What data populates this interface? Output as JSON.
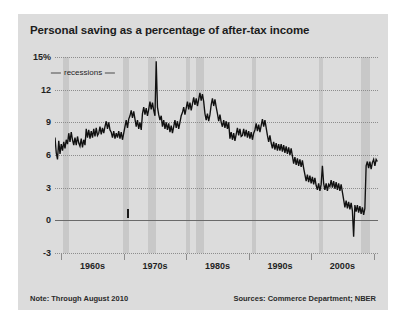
{
  "title": "Personal saving as a percentage of after-tax income",
  "annotation": {
    "recessions_label": "recessions"
  },
  "footer": {
    "note": "Note: Through August 2010",
    "sources": "Sources: Commerce Department; NBER"
  },
  "colors": {
    "panel_background": "#dcdcdc",
    "recession_band": "#c8c8c8",
    "line": "#111111",
    "gridline": "#8d8d8d",
    "zero_line": "#6a6a6a",
    "text": "#1f1f1f"
  },
  "chart_data": {
    "type": "line",
    "title": "Personal saving as a percentage of after-tax income",
    "xlabel": "",
    "ylabel": "",
    "ylim": [
      -3,
      15
    ],
    "xlim": [
      1959,
      2010.7
    ],
    "grid": true,
    "legend": "none",
    "ytick_labels": [
      "15%",
      "12",
      "9",
      "6",
      "3",
      "0",
      "-3"
    ],
    "ytick_values": [
      15,
      12,
      9,
      6,
      3,
      0,
      -3
    ],
    "xtick_labels": [
      "1960s",
      "1970s",
      "1980s",
      "1990s",
      "2000s"
    ],
    "xtick_label_centers": [
      1965,
      1975,
      1985,
      1995,
      2005
    ],
    "xtick_boundaries": [
      1960,
      1970,
      1980,
      1990,
      2000,
      2010
    ],
    "annotations": [
      {
        "text": "recessions",
        "x": 1963.5,
        "y": 13.6,
        "kind": "leader-label"
      }
    ],
    "shaded_regions": [
      {
        "label": "recession",
        "x0": 1960.3,
        "x1": 1961.2
      },
      {
        "label": "recession",
        "x0": 1969.9,
        "x1": 1970.9
      },
      {
        "label": "recession",
        "x0": 1973.9,
        "x1": 1975.2
      },
      {
        "label": "recession",
        "x0": 1980.0,
        "x1": 1980.6
      },
      {
        "label": "recession",
        "x0": 1981.6,
        "x1": 1982.9
      },
      {
        "label": "recession",
        "x0": 1990.6,
        "x1": 1991.2
      },
      {
        "label": "recession",
        "x0": 2001.2,
        "x1": 2001.9
      },
      {
        "label": "recession",
        "x0": 2007.9,
        "x1": 2009.5
      }
    ],
    "series": [
      {
        "name": "Personal saving rate",
        "x": [
          1959.0,
          1959.2,
          1959.4,
          1959.6,
          1959.8,
          1960.0,
          1960.2,
          1960.4,
          1960.6,
          1960.8,
          1961.0,
          1961.2,
          1961.4,
          1961.6,
          1961.8,
          1962.0,
          1962.2,
          1962.4,
          1962.6,
          1962.8,
          1963.0,
          1963.2,
          1963.4,
          1963.6,
          1963.8,
          1964.0,
          1964.2,
          1964.4,
          1964.6,
          1964.8,
          1965.0,
          1965.2,
          1965.4,
          1965.6,
          1965.8,
          1966.0,
          1966.2,
          1966.4,
          1966.6,
          1966.8,
          1967.0,
          1967.2,
          1967.4,
          1967.6,
          1967.8,
          1968.0,
          1968.2,
          1968.4,
          1968.6,
          1968.8,
          1969.0,
          1969.2,
          1969.4,
          1969.6,
          1969.8,
          1970.0,
          1970.2,
          1970.4,
          1970.6,
          1970.8,
          1971.0,
          1971.2,
          1971.4,
          1971.6,
          1971.8,
          1972.0,
          1972.2,
          1972.4,
          1972.6,
          1972.8,
          1973.0,
          1973.2,
          1973.4,
          1973.6,
          1973.8,
          1974.0,
          1974.2,
          1974.4,
          1974.6,
          1974.8,
          1975.0,
          1975.2,
          1975.4,
          1975.6,
          1975.8,
          1976.0,
          1976.2,
          1976.4,
          1976.6,
          1976.8,
          1977.0,
          1977.2,
          1977.4,
          1977.6,
          1977.8,
          1978.0,
          1978.2,
          1978.4,
          1978.6,
          1978.8,
          1979.0,
          1979.2,
          1979.4,
          1979.6,
          1979.8,
          1980.0,
          1980.2,
          1980.4,
          1980.6,
          1980.8,
          1981.0,
          1981.2,
          1981.4,
          1981.6,
          1981.8,
          1982.0,
          1982.2,
          1982.4,
          1982.6,
          1982.8,
          1983.0,
          1983.2,
          1983.4,
          1983.6,
          1983.8,
          1984.0,
          1984.2,
          1984.4,
          1984.6,
          1984.8,
          1985.0,
          1985.2,
          1985.4,
          1985.6,
          1985.8,
          1986.0,
          1986.2,
          1986.4,
          1986.6,
          1986.8,
          1987.0,
          1987.2,
          1987.4,
          1987.6,
          1987.8,
          1988.0,
          1988.2,
          1988.4,
          1988.6,
          1988.8,
          1989.0,
          1989.2,
          1989.4,
          1989.6,
          1989.8,
          1990.0,
          1990.2,
          1990.4,
          1990.6,
          1990.8,
          1991.0,
          1991.2,
          1991.4,
          1991.6,
          1991.8,
          1992.0,
          1992.2,
          1992.4,
          1992.6,
          1992.8,
          1993.0,
          1993.2,
          1993.4,
          1993.6,
          1993.8,
          1994.0,
          1994.2,
          1994.4,
          1994.6,
          1994.8,
          1995.0,
          1995.2,
          1995.4,
          1995.6,
          1995.8,
          1996.0,
          1996.2,
          1996.4,
          1996.6,
          1996.8,
          1997.0,
          1997.2,
          1997.4,
          1997.6,
          1997.8,
          1998.0,
          1998.2,
          1998.4,
          1998.6,
          1998.8,
          1999.0,
          1999.2,
          1999.4,
          1999.6,
          1999.8,
          2000.0,
          2000.2,
          2000.4,
          2000.6,
          2000.8,
          2001.0,
          2001.2,
          2001.4,
          2001.6,
          2001.8,
          2002.0,
          2002.2,
          2002.4,
          2002.6,
          2002.8,
          2003.0,
          2003.2,
          2003.4,
          2003.6,
          2003.8,
          2004.0,
          2004.2,
          2004.4,
          2004.6,
          2004.8,
          2005.0,
          2005.2,
          2005.4,
          2005.6,
          2005.8,
          2006.0,
          2006.2,
          2006.4,
          2006.6,
          2006.8,
          2007.0,
          2007.2,
          2007.4,
          2007.6,
          2007.8,
          2008.0,
          2008.2,
          2008.4,
          2008.6,
          2008.8,
          2009.0,
          2009.2,
          2009.4,
          2009.6,
          2009.8,
          2010.0,
          2010.2,
          2010.4,
          2010.6
        ],
        "values": [
          7.6,
          6.2,
          5.6,
          7.3,
          6.1,
          7.0,
          6.4,
          7.2,
          6.6,
          7.4,
          7.0,
          8.0,
          7.2,
          8.1,
          7.4,
          6.9,
          7.6,
          6.9,
          7.7,
          7.1,
          6.8,
          7.5,
          6.7,
          7.4,
          6.9,
          8.4,
          7.6,
          8.3,
          7.5,
          8.2,
          7.6,
          8.4,
          7.7,
          8.5,
          7.8,
          8.0,
          8.6,
          7.9,
          8.5,
          8.0,
          8.6,
          9.1,
          8.4,
          9.0,
          8.3,
          8.1,
          7.6,
          8.2,
          7.5,
          8.0,
          7.6,
          8.2,
          7.5,
          8.1,
          7.4,
          8.0,
          8.6,
          9.2,
          8.5,
          9.3,
          9.6,
          10.1,
          9.4,
          10.0,
          9.3,
          8.6,
          9.2,
          8.4,
          9.0,
          8.3,
          9.8,
          10.4,
          9.7,
          10.3,
          9.6,
          10.2,
          10.9,
          10.2,
          10.8,
          10.1,
          9.6,
          14.6,
          10.4,
          9.7,
          9.2,
          9.6,
          8.6,
          9.2,
          8.4,
          9.0,
          8.3,
          8.9,
          8.1,
          8.7,
          8.0,
          8.6,
          9.2,
          8.5,
          9.1,
          8.4,
          9.0,
          9.6,
          9.9,
          10.4,
          9.7,
          10.3,
          10.9,
          10.2,
          10.8,
          10.1,
          10.7,
          11.3,
          10.6,
          11.2,
          10.5,
          11.1,
          11.7,
          11.0,
          11.6,
          10.9,
          9.8,
          9.2,
          9.8,
          9.1,
          9.7,
          10.6,
          11.2,
          10.5,
          11.1,
          10.4,
          9.8,
          9.1,
          9.7,
          9.0,
          8.6,
          9.2,
          8.5,
          9.1,
          8.4,
          9.0,
          7.5,
          8.1,
          7.4,
          8.0,
          7.3,
          7.9,
          8.5,
          7.8,
          8.4,
          7.7,
          7.8,
          8.4,
          7.7,
          8.3,
          7.6,
          8.2,
          7.5,
          8.1,
          7.4,
          8.0,
          8.3,
          8.9,
          8.2,
          8.8,
          8.1,
          8.7,
          9.3,
          8.6,
          9.2,
          8.5,
          7.8,
          7.2,
          7.8,
          7.1,
          6.6,
          7.2,
          6.5,
          7.1,
          6.4,
          7.0,
          6.4,
          7.0,
          6.3,
          6.9,
          6.2,
          6.8,
          6.1,
          6.7,
          6.0,
          6.6,
          5.9,
          5.2,
          5.8,
          5.1,
          5.7,
          5.0,
          5.6,
          4.9,
          5.5,
          4.8,
          4.2,
          3.6,
          4.2,
          3.5,
          4.1,
          3.4,
          4.0,
          3.3,
          3.9,
          3.2,
          2.8,
          3.4,
          2.7,
          3.3,
          5.0,
          3.4,
          2.8,
          3.4,
          2.7,
          3.3,
          3.1,
          3.7,
          3.0,
          3.6,
          2.9,
          3.5,
          2.8,
          3.4,
          2.7,
          3.3,
          2.6,
          1.9,
          1.2,
          1.8,
          1.1,
          1.7,
          1.0,
          1.6,
          0.9,
          -1.5,
          1.4,
          0.8,
          1.4,
          0.7,
          1.3,
          0.6,
          1.2,
          0.5,
          1.1,
          5.0,
          5.4,
          4.8,
          5.4,
          4.7,
          5.3,
          5.6,
          5.0,
          5.6,
          5.4
        ]
      }
    ]
  }
}
